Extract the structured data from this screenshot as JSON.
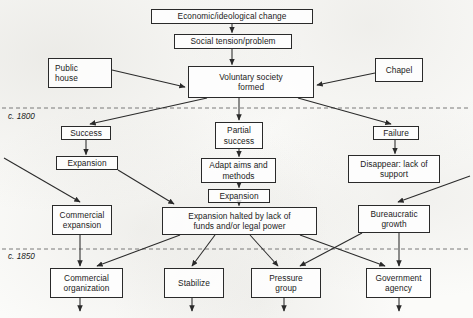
{
  "diagram": {
    "eras": [
      {
        "label": "c. 1800",
        "x": 8,
        "y": 112
      },
      {
        "label": "c. 1850",
        "x": 8,
        "y": 252
      }
    ],
    "nodes": [
      {
        "id": "economic",
        "name": "node-economic-ideological-change",
        "text": "Economic/ideological change",
        "x": 151,
        "y": 9,
        "w": 162,
        "h": 15,
        "align": "center"
      },
      {
        "id": "tension",
        "name": "node-social-tension",
        "text": "Social tension/problem",
        "x": 174,
        "y": 34,
        "w": 118,
        "h": 15,
        "align": "center"
      },
      {
        "id": "publichouse",
        "name": "node-public-house",
        "text": "Public\nhouse",
        "x": 48,
        "y": 58,
        "w": 64,
        "h": 30,
        "align": "left"
      },
      {
        "id": "chapel",
        "name": "node-chapel",
        "text": "Chapel",
        "x": 375,
        "y": 58,
        "w": 48,
        "h": 24,
        "align": "center"
      },
      {
        "id": "voluntary",
        "name": "node-voluntary-society-formed",
        "text": "Voluntary society\nformed",
        "x": 188,
        "y": 66,
        "w": 126,
        "h": 32,
        "align": "center"
      },
      {
        "id": "success",
        "name": "node-success",
        "text": "Success",
        "x": 61,
        "y": 126,
        "w": 50,
        "h": 14,
        "align": "center"
      },
      {
        "id": "partial",
        "name": "node-partial-success",
        "text": "Partial\nsuccess",
        "x": 215,
        "y": 122,
        "w": 48,
        "h": 27,
        "align": "center"
      },
      {
        "id": "failure",
        "name": "node-failure",
        "text": "Failure",
        "x": 373,
        "y": 126,
        "w": 46,
        "h": 14,
        "align": "center"
      },
      {
        "id": "expansion1",
        "name": "node-expansion-left",
        "text": "Expansion",
        "x": 56,
        "y": 156,
        "w": 62,
        "h": 14,
        "align": "center"
      },
      {
        "id": "adapt",
        "name": "node-adapt-aims-methods",
        "text": "Adapt aims and\nmethods",
        "x": 201,
        "y": 158,
        "w": 75,
        "h": 25,
        "align": "center"
      },
      {
        "id": "disappear",
        "name": "node-disappear-lack-support",
        "text": "Disappear: lack of\nsupport",
        "x": 348,
        "y": 155,
        "w": 92,
        "h": 28,
        "align": "center"
      },
      {
        "id": "expansion2",
        "name": "node-expansion-center",
        "text": "Expansion",
        "x": 208,
        "y": 189,
        "w": 62,
        "h": 14,
        "align": "center"
      },
      {
        "id": "commexp",
        "name": "node-commercial-expansion",
        "text": "Commercial\nexpansion",
        "x": 52,
        "y": 205,
        "w": 60,
        "h": 30,
        "align": "center"
      },
      {
        "id": "halted",
        "name": "node-expansion-halted",
        "text": "Expansion halted by lack of\nfunds and/or legal power",
        "x": 162,
        "y": 207,
        "w": 155,
        "h": 28,
        "align": "center"
      },
      {
        "id": "bureau",
        "name": "node-bureaucratic-growth",
        "text": "Bureaucratic\ngrowth",
        "x": 358,
        "y": 205,
        "w": 72,
        "h": 28,
        "align": "center"
      },
      {
        "id": "commorg",
        "name": "node-commercial-organization",
        "text": "Commercial\norganization",
        "x": 50,
        "y": 268,
        "w": 73,
        "h": 30,
        "align": "center"
      },
      {
        "id": "stabilize",
        "name": "node-stabilize",
        "text": "Stabilize",
        "x": 164,
        "y": 268,
        "w": 60,
        "h": 30,
        "align": "center"
      },
      {
        "id": "pressure",
        "name": "node-pressure-group",
        "text": "Pressure\ngroup",
        "x": 251,
        "y": 268,
        "w": 70,
        "h": 30,
        "align": "center"
      },
      {
        "id": "govagency",
        "name": "node-government-agency",
        "text": "Government\nagency",
        "x": 366,
        "y": 268,
        "w": 65,
        "h": 30,
        "align": "center"
      }
    ],
    "connectors": [
      {
        "name": "arrow-economic-to-tension",
        "from": "economic",
        "to": "tension"
      },
      {
        "name": "arrow-tension-to-voluntary",
        "from": "tension",
        "to": "voluntary"
      },
      {
        "name": "arrow-publichouse-to-voluntary",
        "from": "publichouse",
        "to": "voluntary"
      },
      {
        "name": "arrow-chapel-to-voluntary",
        "from": "chapel",
        "to": "voluntary"
      },
      {
        "name": "arrow-voluntary-to-success",
        "from": "voluntary",
        "to": "success"
      },
      {
        "name": "arrow-voluntary-to-partial",
        "from": "voluntary",
        "to": "partial"
      },
      {
        "name": "arrow-voluntary-to-failure",
        "from": "voluntary",
        "to": "failure"
      },
      {
        "name": "arrow-success-to-expansion",
        "from": "success",
        "to": "expansion1"
      },
      {
        "name": "arrow-partial-to-adapt",
        "from": "partial",
        "to": "adapt"
      },
      {
        "name": "arrow-failure-to-disappear",
        "from": "failure",
        "to": "disappear"
      },
      {
        "name": "arrow-adapt-to-expansion",
        "from": "adapt",
        "to": "expansion2"
      },
      {
        "name": "arrow-offpage-to-commercial-expansion",
        "from": "offpage-left",
        "to": "commexp"
      },
      {
        "name": "arrow-expansion-to-halted",
        "from": "expansion1",
        "to": "halted"
      },
      {
        "name": "arrow-expansion2-to-halted",
        "from": "expansion2",
        "to": "halted"
      },
      {
        "name": "arrow-offpage-to-bureaucratic",
        "from": "offpage-right",
        "to": "bureau"
      },
      {
        "name": "arrow-commexp-to-commorg",
        "from": "commexp",
        "to": "commorg"
      },
      {
        "name": "arrow-halted-to-commorg",
        "from": "halted",
        "to": "commorg"
      },
      {
        "name": "arrow-halted-to-stabilize",
        "from": "halted",
        "to": "stabilize"
      },
      {
        "name": "arrow-halted-to-pressure",
        "from": "halted",
        "to": "pressure"
      },
      {
        "name": "arrow-halted-to-govagency",
        "from": "halted",
        "to": "govagency"
      },
      {
        "name": "arrow-bureau-to-pressure",
        "from": "bureau",
        "to": "pressure"
      },
      {
        "name": "arrow-bureau-to-govagency",
        "from": "bureau",
        "to": "govagency"
      },
      {
        "name": "arrow-commorg-down",
        "from": "commorg",
        "to": "offpage-bottom"
      },
      {
        "name": "arrow-stabilize-down",
        "from": "stabilize",
        "to": "offpage-bottom"
      },
      {
        "name": "arrow-pressure-down",
        "from": "pressure",
        "to": "offpage-bottom"
      },
      {
        "name": "arrow-govagency-down",
        "from": "govagency",
        "to": "offpage-bottom"
      }
    ],
    "dividers": [
      {
        "name": "era-divider-1800",
        "y": 108
      },
      {
        "name": "era-divider-1850",
        "y": 249
      }
    ]
  }
}
